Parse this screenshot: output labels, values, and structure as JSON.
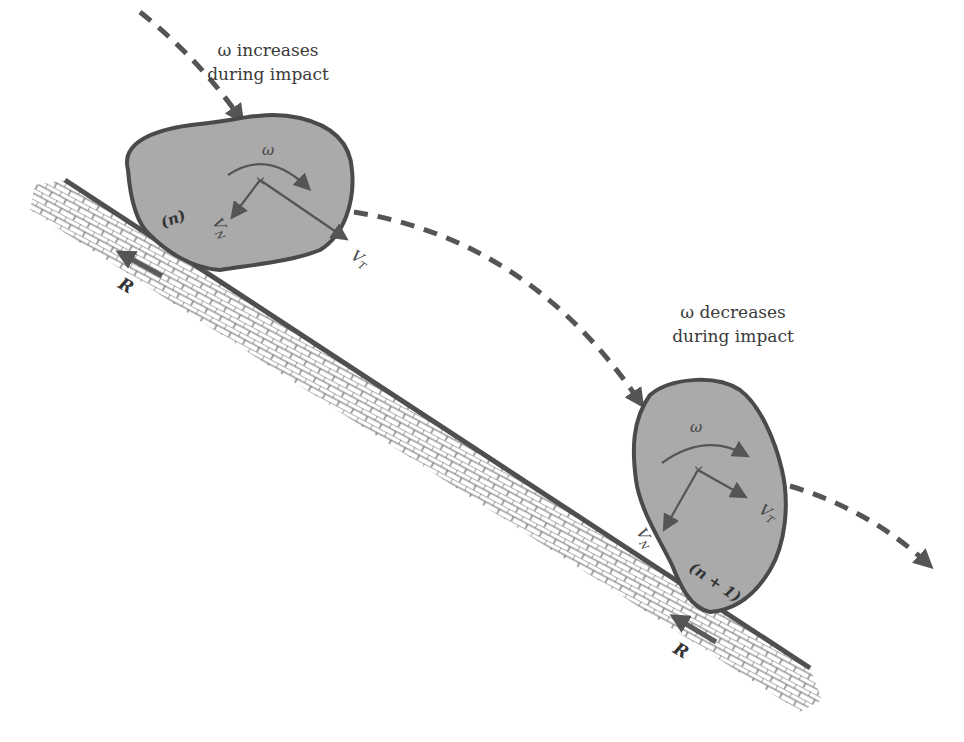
{
  "figure": {
    "type": "rockfall impact diagram",
    "colors": {
      "rock_fill": "#aaaaaa",
      "outline": "#4a4a4a",
      "trajectory": "#555555",
      "background": "#ffffff"
    },
    "impact_1": {
      "caption_line1": "ω increases",
      "caption_line2": "during impact",
      "omega_label": "ω",
      "vn_label": "V",
      "vn_sub": "N",
      "vt_label": "V",
      "vt_sub": "T",
      "contact_label": "(n)",
      "reaction_label": "R"
    },
    "impact_2": {
      "caption_line1": "ω decreases",
      "caption_line2": "during impact",
      "omega_label": "ω",
      "vn_label": "V",
      "vn_sub": "N",
      "vt_label": "V",
      "vt_sub": "T",
      "contact_label": "(n + 1)",
      "reaction_label": "R"
    }
  }
}
